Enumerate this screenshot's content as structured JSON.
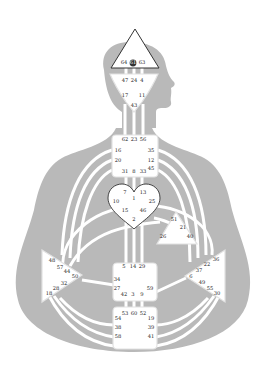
{
  "colors": {
    "silhouette": "#b9b9b9",
    "background": "#ffffff",
    "center_fill": "#ffffff",
    "channel": "#ffffff",
    "text": "#222222",
    "outline": "#333333"
  },
  "centers": {
    "head": {
      "name": "Head",
      "gates": [
        "64",
        "61",
        "63"
      ],
      "highlighted_gate": "61"
    },
    "ajna": {
      "name": "Ajna",
      "gates": [
        "47",
        "24",
        "4",
        "17",
        "11",
        "43"
      ]
    },
    "throat": {
      "name": "Throat",
      "gates": [
        "62",
        "23",
        "56",
        "16",
        "35",
        "20",
        "12",
        "45",
        "31",
        "8",
        "33"
      ]
    },
    "g": {
      "name": "G Center",
      "gates": [
        "7",
        "1",
        "13",
        "10",
        "25",
        "15",
        "46",
        "2"
      ]
    },
    "ego": {
      "name": "Ego",
      "gates": [
        "51",
        "21",
        "26",
        "40"
      ]
    },
    "spleen": {
      "name": "Spleen",
      "gates": [
        "48",
        "57",
        "44",
        "50",
        "32",
        "28",
        "18"
      ]
    },
    "solar_plexus": {
      "name": "Solar Plexus",
      "gates": [
        "36",
        "22",
        "37",
        "6",
        "49",
        "55",
        "30"
      ]
    },
    "sacral": {
      "name": "Sacral",
      "gates": [
        "5",
        "14",
        "29",
        "34",
        "27",
        "59",
        "42",
        "3",
        "9"
      ]
    },
    "root": {
      "name": "Root",
      "gates": [
        "53",
        "60",
        "52",
        "54",
        "19",
        "38",
        "39",
        "58",
        "41"
      ]
    }
  }
}
